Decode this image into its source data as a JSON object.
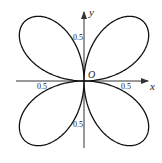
{
  "diagram": {
    "type": "polar-rose",
    "equation_shape": "four-leaf rose",
    "origin_label": "O",
    "x_axis_label": "x",
    "y_axis_label": "y",
    "tick_labels": {
      "x_positive": "0.5",
      "x_negative": "0.5",
      "y_positive": "0.5",
      "y_negative": "0.5"
    },
    "curve_color": "#111111",
    "axis_color": "#333333"
  }
}
